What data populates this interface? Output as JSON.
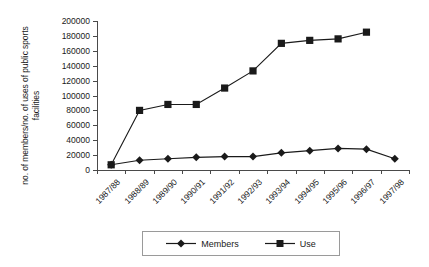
{
  "chart_data": {
    "type": "line",
    "title": "",
    "xlabel": "",
    "ylabel": "no. of members/no. of uses of public sports facilities",
    "ylim": [
      0,
      200000
    ],
    "ytick_step": 20000,
    "yticks": [
      0,
      20000,
      40000,
      60000,
      80000,
      100000,
      120000,
      140000,
      160000,
      180000,
      200000
    ],
    "ytick_labels": [
      "0",
      "20000",
      "40000",
      "60000",
      "80000",
      "100000",
      "120000",
      "140000",
      "160000",
      "180000",
      "200000"
    ],
    "grid": false,
    "legend_position": "bottom",
    "categories": [
      "1987/88",
      "1988/89",
      "1989/90",
      "1990/91",
      "1991/92",
      "1992/93",
      "1993/94",
      "1994/95",
      "1995/96",
      "1996/97",
      "1997/98"
    ],
    "series": [
      {
        "name": "Members",
        "marker": "diamond",
        "color": "#1a1a1a",
        "values": [
          7000,
          13000,
          15000,
          17000,
          18000,
          18000,
          23000,
          26000,
          29000,
          28000,
          15000
        ]
      },
      {
        "name": "Use",
        "marker": "square",
        "color": "#1a1a1a",
        "values": [
          7000,
          80000,
          88000,
          88000,
          110000,
          133000,
          170000,
          174000,
          176000,
          185000,
          null
        ]
      }
    ]
  },
  "legend": {
    "items": [
      {
        "label": "Members",
        "marker": "diamond-marker"
      },
      {
        "label": "Use",
        "marker": "square-marker"
      }
    ]
  }
}
